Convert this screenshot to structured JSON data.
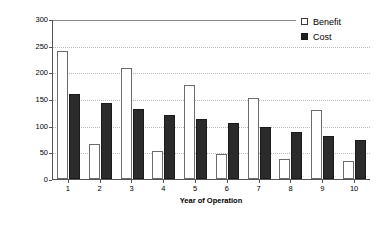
{
  "chart_data": {
    "type": "bar",
    "title": "",
    "xlabel": "Year of Operation",
    "ylabel": "$/kW Present Worth",
    "categories": [
      "1",
      "2",
      "3",
      "4",
      "5",
      "6",
      "7",
      "8",
      "9",
      "10"
    ],
    "series": [
      {
        "name": "Benefit",
        "color": "#ffffff",
        "values": [
          240,
          66,
          208,
          53,
          177,
          47,
          152,
          38,
          129,
          34
        ]
      },
      {
        "name": "Cost",
        "color": "#2b2b2b",
        "values": [
          160,
          142,
          131,
          120,
          113,
          105,
          97,
          89,
          81,
          74
        ]
      }
    ],
    "ylim": [
      0,
      300
    ],
    "yticks": [
      0,
      50,
      100,
      150,
      200,
      250,
      300
    ],
    "ytick_labels": [
      "0",
      "50",
      "100",
      "150",
      "200",
      "250",
      "300"
    ],
    "grid": true,
    "legend_position": "top-right"
  },
  "legend": {
    "entries": [
      {
        "label": "Benefit",
        "swatch": "open-square"
      },
      {
        "label": "Cost",
        "swatch": "filled-square"
      }
    ]
  }
}
